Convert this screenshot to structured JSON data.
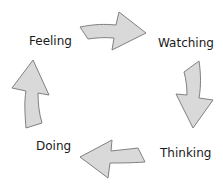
{
  "diagram": {
    "type": "cycle",
    "colors": {
      "arrow_fill": "#d9d9d9",
      "arrow_stroke": "#808080",
      "text": "#1a1a1a",
      "background": "#ffffff"
    },
    "stages": [
      {
        "label": "Feeling"
      },
      {
        "label": "Watching"
      },
      {
        "label": "Thinking"
      },
      {
        "label": "Doing"
      }
    ],
    "arrows": [
      {
        "from": "Feeling",
        "to": "Watching",
        "icon": "arrow-right-icon"
      },
      {
        "from": "Watching",
        "to": "Thinking",
        "icon": "arrow-down-icon"
      },
      {
        "from": "Thinking",
        "to": "Doing",
        "icon": "arrow-left-icon"
      },
      {
        "from": "Doing",
        "to": "Feeling",
        "icon": "arrow-up-icon"
      }
    ]
  }
}
